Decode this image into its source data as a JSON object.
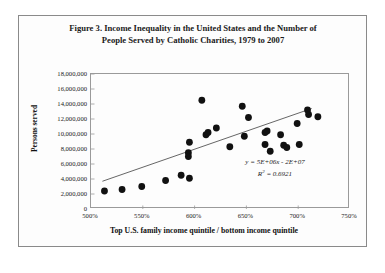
{
  "figure": {
    "title_line1": "Figure 3. Income Inequality in the United States and the Number of",
    "title_line2": "People Served by Catholic Charities, 1979 to 2007"
  },
  "axes": {
    "ylabel": "Persons served",
    "xlabel": "Top U.S. family income quintile / bottom income quintile",
    "yticks": [
      "0",
      "2,000,000",
      "4,000,000",
      "6,000,000",
      "8,000,000",
      "10,000,000",
      "12,000,000",
      "14,000,000",
      "16,000,000",
      "18,000,000"
    ],
    "xticks": [
      "500%",
      "550%",
      "600%",
      "650%",
      "700%",
      "750%"
    ]
  },
  "annotation": {
    "equation": "y = 5E+06x - 2E+07",
    "r_squared_prefix": "R",
    "r_squared_exp": "2",
    "r_squared_value": " = 0.6921"
  },
  "chart_data": {
    "type": "scatter",
    "title": "Figure 3. Income Inequality in the United States and the Number of People Served by Catholic Charities, 1979 to 2007",
    "xlabel": "Top U.S. family income quintile / bottom income quintile",
    "ylabel": "Persons served",
    "xlim": [
      500,
      750
    ],
    "ylim": [
      0,
      18000000
    ],
    "xtick_values": [
      500,
      550,
      600,
      650,
      700,
      750
    ],
    "ytick_values": [
      0,
      2000000,
      4000000,
      6000000,
      8000000,
      10000000,
      12000000,
      14000000,
      16000000,
      18000000
    ],
    "grid": false,
    "legend": null,
    "marker": {
      "shape": "circle",
      "color": "#111111",
      "size": 3.4
    },
    "points": [
      {
        "x": 513,
        "y": 2400000
      },
      {
        "x": 530,
        "y": 2600000
      },
      {
        "x": 549,
        "y": 3000000
      },
      {
        "x": 572,
        "y": 3800000
      },
      {
        "x": 587,
        "y": 4500000
      },
      {
        "x": 595,
        "y": 4100000
      },
      {
        "x": 594,
        "y": 7500000
      },
      {
        "x": 595,
        "y": 8900000
      },
      {
        "x": 594,
        "y": 7000000
      },
      {
        "x": 607,
        "y": 14500000
      },
      {
        "x": 611,
        "y": 9900000
      },
      {
        "x": 613,
        "y": 10200000
      },
      {
        "x": 621,
        "y": 10800000
      },
      {
        "x": 634,
        "y": 8300000
      },
      {
        "x": 646,
        "y": 13700000
      },
      {
        "x": 652,
        "y": 12200000
      },
      {
        "x": 648,
        "y": 9700000
      },
      {
        "x": 668,
        "y": 10200000
      },
      {
        "x": 670,
        "y": 10400000
      },
      {
        "x": 668,
        "y": 8600000
      },
      {
        "x": 673,
        "y": 7700000
      },
      {
        "x": 683,
        "y": 9900000
      },
      {
        "x": 686,
        "y": 8500000
      },
      {
        "x": 689,
        "y": 8200000
      },
      {
        "x": 699,
        "y": 11400000
      },
      {
        "x": 701,
        "y": 8600000
      },
      {
        "x": 709,
        "y": 13200000
      },
      {
        "x": 710,
        "y": 12600000
      },
      {
        "x": 719,
        "y": 12300000
      }
    ],
    "trendline": {
      "equation": "y = 5E+06x - 2E+07",
      "r_squared": 0.6921,
      "x_start": 511,
      "y_start": 3700000,
      "x_end": 713,
      "y_end": 13400000,
      "color": "#555555"
    }
  }
}
